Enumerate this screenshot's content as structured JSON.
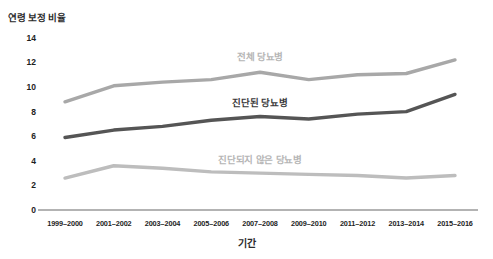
{
  "chart_data": {
    "type": "line",
    "title": "",
    "xlabel": "기간",
    "ylabel": "연령 보정 비율",
    "categories": [
      "1999–2000",
      "2001–2002",
      "2003–2004",
      "2005–2006",
      "2007–2008",
      "2009–2010",
      "2011–2012",
      "2013–2014",
      "2015–2016"
    ],
    "yticks": [
      0,
      2,
      4,
      6,
      8,
      10,
      12,
      14
    ],
    "ylim": [
      0,
      14.8
    ],
    "grid": false,
    "legend_position": "inline-labels",
    "series": [
      {
        "name": "전체 당뇨병",
        "color": "#a8a8a8",
        "values": [
          8.8,
          10.1,
          10.4,
          10.6,
          11.2,
          10.6,
          11.0,
          11.1,
          12.2
        ]
      },
      {
        "name": "진단된 당뇨병",
        "color": "#555555",
        "values": [
          5.9,
          6.5,
          6.8,
          7.3,
          7.6,
          7.4,
          7.8,
          8.0,
          9.4
        ]
      },
      {
        "name": "진단되지 않은 당뇨병",
        "color": "#bdbdbd",
        "values": [
          2.6,
          3.6,
          3.4,
          3.1,
          3.0,
          2.9,
          2.8,
          2.6,
          2.8
        ]
      }
    ]
  },
  "axis": {
    "baseline_color": "#9a9a9a"
  }
}
